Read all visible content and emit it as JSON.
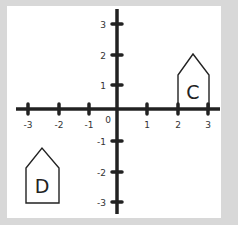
{
  "diagram": {
    "type": "coordinate-plane",
    "colors": {
      "background": "#d8d8d8",
      "panel": "#ffffff",
      "axis": "#222222",
      "shape_stroke": "#222222",
      "text": "#333333"
    },
    "axes": {
      "x_range": [
        -3,
        3
      ],
      "y_range": [
        -3,
        3
      ],
      "origin_label": "0",
      "x_ticks": [
        {
          "value": -3,
          "label": "-3"
        },
        {
          "value": -2,
          "label": "-2"
        },
        {
          "value": -1,
          "label": "-1"
        },
        {
          "value": 1,
          "label": "1"
        },
        {
          "value": 2,
          "label": "2"
        },
        {
          "value": 3,
          "label": "3"
        }
      ],
      "y_ticks": [
        {
          "value": 3,
          "label": "3"
        },
        {
          "value": 2,
          "label": "2"
        },
        {
          "value": 1,
          "label": "1"
        },
        {
          "value": -1,
          "label": "-1"
        },
        {
          "value": -2,
          "label": "-2"
        },
        {
          "value": -3,
          "label": "-3"
        }
      ]
    },
    "shapes": [
      {
        "label": "C",
        "kind": "pentagon-house",
        "vertices": [
          [
            2,
            0
          ],
          [
            3,
            0
          ],
          [
            3,
            1.1
          ],
          [
            2.5,
            1.8
          ],
          [
            2,
            1.1
          ]
        ]
      },
      {
        "label": "D",
        "kind": "pentagon-house",
        "vertices": [
          [
            -2.95,
            -3.0
          ],
          [
            -1.9,
            -3.0
          ],
          [
            -1.9,
            -1.95
          ],
          [
            -2.45,
            -1.3
          ],
          [
            -2.95,
            -1.95
          ]
        ]
      }
    ]
  }
}
